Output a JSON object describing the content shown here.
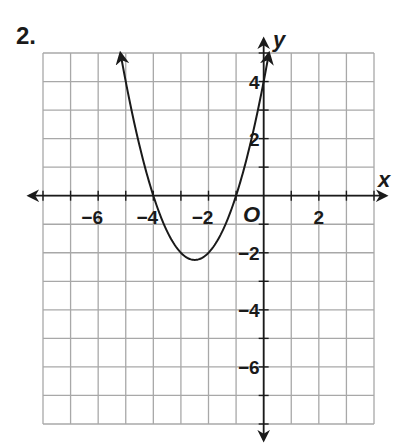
{
  "problem": {
    "number": "2."
  },
  "chart_data": {
    "type": "line",
    "title": "",
    "xlabel": "x",
    "ylabel": "y",
    "origin_label": "O",
    "grid": true,
    "xlim": [
      -8,
      4
    ],
    "ylim": [
      -8,
      5
    ],
    "x_ticks": [
      -6,
      -4,
      -2,
      2
    ],
    "x_tick_labels": [
      "−6",
      "−4",
      "−2",
      "2"
    ],
    "y_ticks": [
      4,
      2,
      -2,
      -4,
      -6
    ],
    "y_tick_labels": [
      "4",
      "2",
      "−2",
      "−4",
      "−6"
    ],
    "series": [
      {
        "name": "parabola",
        "equation": "y = x^2 + 5x + 4",
        "arrows_both_ends": true,
        "x_range": [
          -5.19,
          0.19
        ],
        "key_points": [
          {
            "label": "x-intercept",
            "x": -4,
            "y": 0
          },
          {
            "label": "x-intercept",
            "x": -1,
            "y": 0
          },
          {
            "label": "vertex",
            "x": -2.5,
            "y": -2.25
          },
          {
            "label": "y-intercept",
            "x": 0,
            "y": 4
          },
          {
            "label": "point",
            "x": -5,
            "y": 4
          }
        ]
      }
    ]
  },
  "colors": {
    "grid": "#a8a8a8",
    "ink": "#1a1a1a",
    "background": "#ffffff"
  }
}
